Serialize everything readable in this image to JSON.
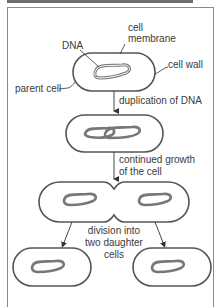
{
  "diagram": {
    "labels": {
      "dna": "DNA",
      "cell_membrane_line1": "cell",
      "cell_membrane_line2": "membrane",
      "cell_wall": "cell wall",
      "parent_cell": "parent cell"
    },
    "steps": [
      {
        "line1": "duplication of DNA"
      },
      {
        "line1": "continued growth",
        "line2": "of the cell"
      },
      {
        "line1": "division into",
        "line2": "two daughter",
        "line3": "cells"
      }
    ],
    "colors": {
      "outline": "#555555",
      "dna": "#666666",
      "text": "#3a3a3a",
      "frame": "#8a8a8a"
    }
  }
}
